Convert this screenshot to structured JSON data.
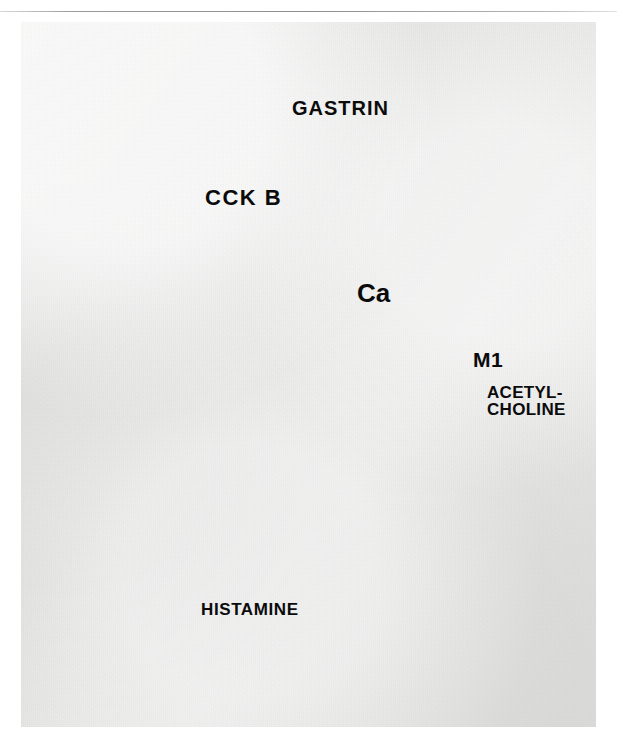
{
  "figure": {
    "kind": "scientific-illustration",
    "background_color": "#e6e6e5",
    "rule_color": "#8e8e8e"
  },
  "labels": {
    "gastrin": "GASTRIN",
    "cck_b": "CCK B",
    "calcium": "Ca",
    "m1": "M1",
    "acetylcholine_line1": "ACETYL-",
    "acetylcholine_line2": "CHOLINE",
    "histamine": "HISTAMINE"
  },
  "arrows": {
    "gastrin_arrow": {
      "name": "gastrin-stimulus-arrow",
      "direction": "down",
      "color": "#5a5a5a"
    },
    "second_messenger_arrow": {
      "name": "curved-stimulus-arrow",
      "direction": "down-left",
      "color": "#5a5a5a"
    },
    "calcium_influx_arrow": {
      "name": "calcium-influx-arrow",
      "direction": "up",
      "color": "#3c3c3c"
    }
  },
  "receptors": [
    {
      "name": "cck-b-receptor",
      "label": "CCK B",
      "ligand": "GASTRIN",
      "style": "serpentine-vertical",
      "color": "#9a9a9a"
    },
    {
      "name": "m1-receptor",
      "label": "M1",
      "ligand": "ACETYLCHOLINE",
      "style": "serpentine-horizontal",
      "color": "#7d7d7d"
    }
  ],
  "cell": {
    "name": "ecl-cell",
    "cytoplasm_color": "#9c9c9a",
    "nucleus_color": "#d9d9d6",
    "granule_light_color": "#e9e9e6",
    "granule_dark_color": "#5d5d5c",
    "outline_color": "#7a7a78"
  },
  "secretion": {
    "name": "histamine-granules",
    "label": "HISTAMINE",
    "granule_color": "#dcdcda",
    "count": 52
  }
}
